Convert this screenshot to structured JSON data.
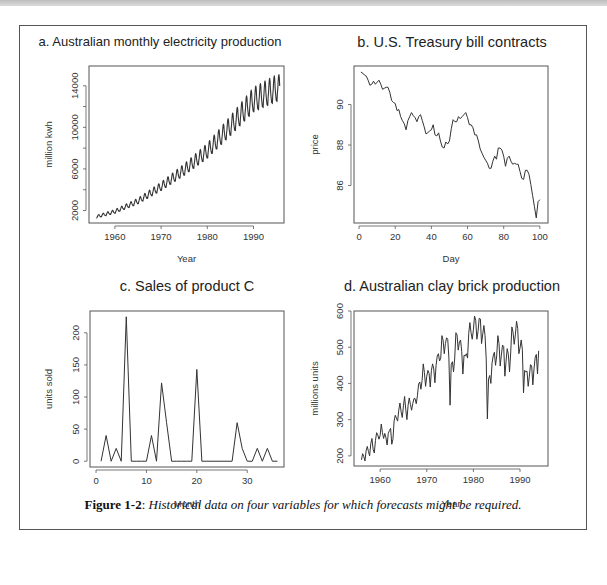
{
  "caption": {
    "label": "Figure 1-2",
    "separator": ":",
    "text": "Historical data on four variables for which forecasts might be required."
  },
  "chart_data": [
    {
      "id": "a",
      "type": "line",
      "title": "a. Australian monthly electricity production",
      "xlabel": "Year",
      "ylabel": "million kwh",
      "xlim": [
        1954.4,
        1996.6
      ],
      "ylim": [
        800,
        15900
      ],
      "xticks": [
        1960,
        1970,
        1980,
        1990
      ],
      "yticks": [
        2000,
        4000,
        6000,
        8000,
        10000,
        12000,
        14000
      ],
      "ytick_labels": [
        "2000",
        "",
        "6000",
        "",
        "10000",
        "",
        "14000"
      ],
      "grid": false,
      "generator": {
        "start": 1956.0,
        "end": 1995.67,
        "step_months": 1,
        "description": "monthly, exponential-like trend with strong annual seasonality"
      },
      "trend_points": [
        [
          1956,
          1400
        ],
        [
          1960,
          1900
        ],
        [
          1965,
          2900
        ],
        [
          1970,
          4300
        ],
        [
          1975,
          5900
        ],
        [
          1980,
          7700
        ],
        [
          1985,
          10100
        ],
        [
          1990,
          12600
        ],
        [
          1995,
          13700
        ]
      ],
      "seasonal_amplitude_fraction": 0.09
    },
    {
      "id": "b",
      "type": "line",
      "title": "b. U.S. Treasury bill contracts",
      "xlabel": "Day",
      "ylabel": "price",
      "xlim": [
        -2.8,
        104.5
      ],
      "ylim": [
        84.15,
        91.9
      ],
      "xticks": [
        0,
        20,
        40,
        60,
        80,
        100
      ],
      "yticks": [
        86,
        88,
        90
      ],
      "grid": false,
      "x": [
        1,
        2,
        3,
        4,
        5,
        6,
        7,
        8,
        9,
        10,
        11,
        12,
        13,
        14,
        15,
        16,
        17,
        18,
        19,
        20,
        21,
        22,
        23,
        24,
        25,
        26,
        27,
        28,
        29,
        30,
        31,
        32,
        33,
        34,
        35,
        36,
        37,
        38,
        39,
        40,
        41,
        42,
        43,
        44,
        45,
        46,
        47,
        48,
        49,
        50,
        51,
        52,
        53,
        54,
        55,
        56,
        57,
        58,
        59,
        60,
        61,
        62,
        63,
        64,
        65,
        66,
        67,
        68,
        69,
        70,
        71,
        72,
        73,
        74,
        75,
        76,
        77,
        78,
        79,
        80,
        81,
        82,
        83,
        84,
        85,
        86,
        87,
        88,
        89,
        90,
        91,
        92,
        93,
        94,
        95,
        96,
        97,
        98,
        99,
        100
      ],
      "values": [
        91.6,
        91.55,
        91.45,
        91.4,
        91.2,
        90.95,
        91.0,
        91.15,
        91.0,
        91.1,
        91.2,
        91.0,
        90.75,
        90.8,
        90.85,
        90.85,
        90.6,
        90.2,
        90.1,
        90.05,
        89.7,
        89.75,
        89.4,
        89.2,
        89.05,
        88.75,
        89.2,
        89.4,
        89.6,
        89.45,
        89.35,
        89.15,
        89.4,
        89.5,
        89.2,
        88.9,
        88.55,
        88.6,
        88.7,
        88.75,
        89.0,
        88.5,
        88.45,
        88.6,
        88.2,
        87.9,
        87.85,
        88.15,
        88.05,
        88.2,
        88.8,
        89.25,
        89.15,
        89.15,
        89.4,
        89.3,
        89.4,
        89.5,
        89.6,
        89.35,
        89.0,
        89.0,
        88.85,
        88.5,
        88.5,
        88.2,
        87.8,
        87.6,
        87.4,
        87.25,
        87.1,
        86.85,
        86.85,
        87.2,
        87.45,
        87.3,
        87.85,
        87.85,
        87.75,
        87.45,
        86.95,
        87.35,
        87.45,
        87.2,
        87.05,
        87.1,
        87.05,
        87.05,
        86.7,
        86.35,
        86.3,
        86.75,
        86.75,
        86.55,
        86.05,
        85.5,
        84.95,
        84.4,
        85.2,
        85.3
      ]
    },
    {
      "id": "c",
      "type": "line",
      "title": "c. Sales of product C",
      "xlabel": "Month",
      "ylabel": "units sold",
      "xlim": [
        -1.2,
        37.3
      ],
      "ylim": [
        -9,
        234
      ],
      "xticks": [
        0,
        10,
        20,
        30
      ],
      "yticks": [
        0,
        50,
        100,
        150,
        200
      ],
      "grid": false,
      "x": [
        1,
        2,
        3,
        4,
        5,
        6,
        7,
        8,
        9,
        10,
        11,
        12,
        13,
        14,
        15,
        16,
        17,
        18,
        19,
        20,
        21,
        22,
        23,
        24,
        25,
        26,
        27,
        28,
        29,
        30,
        31,
        32,
        33,
        34,
        35,
        36
      ],
      "values": [
        0,
        40,
        0,
        20,
        0,
        225,
        0,
        0,
        0,
        0,
        40,
        0,
        122,
        60,
        0,
        0,
        0,
        0,
        0,
        143,
        0,
        0,
        0,
        0,
        0,
        0,
        0,
        60,
        20,
        0,
        0,
        20,
        0,
        20,
        0,
        0
      ]
    },
    {
      "id": "d",
      "type": "line",
      "title": "d. Australian clay brick production",
      "xlabel": "Year",
      "ylabel": "millions units",
      "xlim": [
        1954.4,
        1996.0
      ],
      "ylim": [
        172,
        600
      ],
      "xticks": [
        1960,
        1970,
        1980,
        1990
      ],
      "yticks": [
        200,
        300,
        400,
        500,
        600
      ],
      "grid": false,
      "x_start": 1956.0,
      "x_step": 0.25,
      "values": [
        189,
        206,
        198,
        186,
        214,
        226,
        212,
        200,
        234,
        248,
        218,
        208,
        242,
        264,
        258,
        246,
        256,
        288,
        264,
        248,
        262,
        250,
        230,
        262,
        270,
        276,
        232,
        246,
        296,
        312,
        304,
        296,
        326,
        346,
        322,
        306,
        338,
        364,
        328,
        300,
        340,
        360,
        342,
        326,
        344,
        358,
        358,
        344,
        366,
        398,
        404,
        384,
        408,
        454,
        430,
        392,
        420,
        436,
        428,
        390,
        436,
        454,
        440,
        402,
        450,
        476,
        482,
        462,
        470,
        532,
        520,
        482,
        510,
        526,
        522,
        470,
        340,
        452,
        460,
        432,
        470,
        540,
        534,
        492,
        514,
        520,
        488,
        426,
        478,
        476,
        482,
        470,
        538,
        568,
        540,
        522,
        548,
        586,
        574,
        522,
        544,
        580,
        578,
        510,
        536,
        560,
        532,
        468,
        302,
        412,
        422,
        400,
        456,
        476,
        486,
        450,
        476,
        532,
        510,
        448,
        478,
        506,
        502,
        420,
        460,
        496,
        480,
        432,
        484,
        556,
        542,
        508,
        534,
        572,
        552,
        482,
        498,
        520,
        494,
        374,
        436,
        432,
        434,
        392,
        420,
        452,
        448,
        396,
        440,
        472,
        480,
        426,
        490
      ]
    }
  ]
}
